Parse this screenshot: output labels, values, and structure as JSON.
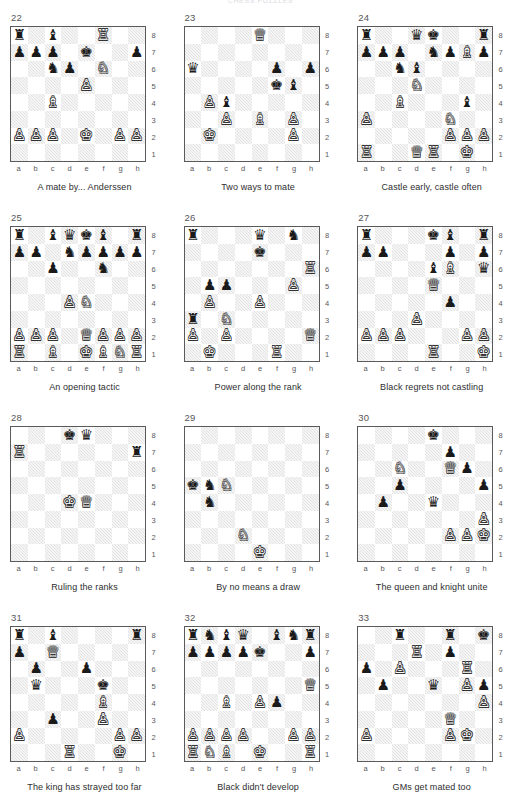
{
  "page": {
    "header": "CHESS PUZZLES",
    "files": [
      "a",
      "b",
      "c",
      "d",
      "e",
      "f",
      "g",
      "h"
    ],
    "ranks": [
      "8",
      "7",
      "6",
      "5",
      "4",
      "3",
      "2",
      "1"
    ],
    "colors": {
      "light_square": "#ffffff",
      "dark_square": "#e3e3e3",
      "board_border": "#5a5a5a",
      "text": "#2e2e30",
      "coord_text": "#58585c",
      "number_text": "#555558"
    },
    "glyphs": {
      "wK": "♔",
      "wQ": "♕",
      "wR": "♖",
      "wB": "♗",
      "wN": "♘",
      "wP": "♙",
      "bK": "♚",
      "bQ": "♛",
      "bR": "♜",
      "bB": "♝",
      "bN": "♞",
      "bP": "♟"
    }
  },
  "chart_data": {
    "type": "table",
    "note": "Twelve chess board diagrams arranged in a 3-column by 4-row grid; each has a number label, an 8x8 position with algebraic coordinates, and a caption.",
    "columns": 3,
    "rows": 4,
    "puzzles": [
      {
        "number": "22",
        "caption": "A mate by... Anderssen",
        "pieces": [
          {
            "sq": "a8",
            "p": "bR"
          },
          {
            "sq": "c8",
            "p": "bB"
          },
          {
            "sq": "f8",
            "p": "wR"
          },
          {
            "sq": "a7",
            "p": "bP"
          },
          {
            "sq": "b7",
            "p": "bP"
          },
          {
            "sq": "c7",
            "p": "bP"
          },
          {
            "sq": "e7",
            "p": "bK"
          },
          {
            "sq": "h7",
            "p": "bP"
          },
          {
            "sq": "c6",
            "p": "bN"
          },
          {
            "sq": "d6",
            "p": "bP"
          },
          {
            "sq": "f6",
            "p": "wN"
          },
          {
            "sq": "e5",
            "p": "wP"
          },
          {
            "sq": "c4",
            "p": "wB"
          },
          {
            "sq": "a2",
            "p": "wP"
          },
          {
            "sq": "b2",
            "p": "wP"
          },
          {
            "sq": "c2",
            "p": "wP"
          },
          {
            "sq": "e2",
            "p": "wK"
          },
          {
            "sq": "g2",
            "p": "wP"
          },
          {
            "sq": "h2",
            "p": "wP"
          }
        ]
      },
      {
        "number": "23",
        "caption": "Two ways to mate",
        "pieces": [
          {
            "sq": "e8",
            "p": "wQ"
          },
          {
            "sq": "a6",
            "p": "bQ"
          },
          {
            "sq": "f6",
            "p": "bP"
          },
          {
            "sq": "h6",
            "p": "bP"
          },
          {
            "sq": "f5",
            "p": "bK"
          },
          {
            "sq": "g5",
            "p": "bB"
          },
          {
            "sq": "b4",
            "p": "wP"
          },
          {
            "sq": "c4",
            "p": "bB"
          },
          {
            "sq": "c3",
            "p": "wP"
          },
          {
            "sq": "e3",
            "p": "wB"
          },
          {
            "sq": "g3",
            "p": "wP"
          },
          {
            "sq": "b2",
            "p": "wK"
          },
          {
            "sq": "g2",
            "p": "wP"
          }
        ]
      },
      {
        "number": "24",
        "caption": "Castle early, castle often",
        "pieces": [
          {
            "sq": "a8",
            "p": "bR"
          },
          {
            "sq": "d8",
            "p": "bQ"
          },
          {
            "sq": "e8",
            "p": "bK"
          },
          {
            "sq": "h8",
            "p": "bR"
          },
          {
            "sq": "a7",
            "p": "bP"
          },
          {
            "sq": "b7",
            "p": "bP"
          },
          {
            "sq": "c7",
            "p": "bP"
          },
          {
            "sq": "e7",
            "p": "bN"
          },
          {
            "sq": "f7",
            "p": "bP"
          },
          {
            "sq": "g7",
            "p": "wB"
          },
          {
            "sq": "h7",
            "p": "bP"
          },
          {
            "sq": "c6",
            "p": "bN"
          },
          {
            "sq": "d6",
            "p": "bB"
          },
          {
            "sq": "d5",
            "p": "wN"
          },
          {
            "sq": "c4",
            "p": "wB"
          },
          {
            "sq": "g4",
            "p": "bB"
          },
          {
            "sq": "a3",
            "p": "wP"
          },
          {
            "sq": "f3",
            "p": "wN"
          },
          {
            "sq": "f2",
            "p": "wP"
          },
          {
            "sq": "g2",
            "p": "wP"
          },
          {
            "sq": "h2",
            "p": "wP"
          },
          {
            "sq": "a1",
            "p": "wR"
          },
          {
            "sq": "d1",
            "p": "wQ"
          },
          {
            "sq": "e1",
            "p": "wR"
          },
          {
            "sq": "g1",
            "p": "wK"
          }
        ]
      },
      {
        "number": "25",
        "caption": "An opening tactic",
        "pieces": [
          {
            "sq": "a8",
            "p": "bR"
          },
          {
            "sq": "c8",
            "p": "bB"
          },
          {
            "sq": "d8",
            "p": "bQ"
          },
          {
            "sq": "e8",
            "p": "bK"
          },
          {
            "sq": "f8",
            "p": "bB"
          },
          {
            "sq": "h8",
            "p": "bR"
          },
          {
            "sq": "a7",
            "p": "bP"
          },
          {
            "sq": "b7",
            "p": "bP"
          },
          {
            "sq": "d7",
            "p": "bN"
          },
          {
            "sq": "e7",
            "p": "bP"
          },
          {
            "sq": "f7",
            "p": "bP"
          },
          {
            "sq": "g7",
            "p": "bP"
          },
          {
            "sq": "h7",
            "p": "bP"
          },
          {
            "sq": "c6",
            "p": "bP"
          },
          {
            "sq": "f6",
            "p": "bN"
          },
          {
            "sq": "d4",
            "p": "wP"
          },
          {
            "sq": "e4",
            "p": "wN"
          },
          {
            "sq": "a2",
            "p": "wP"
          },
          {
            "sq": "b2",
            "p": "wP"
          },
          {
            "sq": "c2",
            "p": "wP"
          },
          {
            "sq": "e2",
            "p": "wQ"
          },
          {
            "sq": "f2",
            "p": "wP"
          },
          {
            "sq": "g2",
            "p": "wP"
          },
          {
            "sq": "h2",
            "p": "wP"
          },
          {
            "sq": "a1",
            "p": "wR"
          },
          {
            "sq": "c1",
            "p": "wB"
          },
          {
            "sq": "e1",
            "p": "wK"
          },
          {
            "sq": "f1",
            "p": "wB"
          },
          {
            "sq": "g1",
            "p": "wN"
          },
          {
            "sq": "h1",
            "p": "wR"
          }
        ]
      },
      {
        "number": "26",
        "caption": "Power along the rank",
        "pieces": [
          {
            "sq": "a8",
            "p": "bR"
          },
          {
            "sq": "e8",
            "p": "bQ"
          },
          {
            "sq": "g8",
            "p": "bN"
          },
          {
            "sq": "e7",
            "p": "bK"
          },
          {
            "sq": "h6",
            "p": "wR"
          },
          {
            "sq": "b5",
            "p": "bP"
          },
          {
            "sq": "c5",
            "p": "bP"
          },
          {
            "sq": "g5",
            "p": "wP"
          },
          {
            "sq": "b4",
            "p": "wP"
          },
          {
            "sq": "e4",
            "p": "wP"
          },
          {
            "sq": "a3",
            "p": "bR"
          },
          {
            "sq": "c3",
            "p": "wN"
          },
          {
            "sq": "a2",
            "p": "wP"
          },
          {
            "sq": "c2",
            "p": "wP"
          },
          {
            "sq": "h2",
            "p": "wQ"
          },
          {
            "sq": "b1",
            "p": "wK"
          },
          {
            "sq": "f1",
            "p": "wR"
          }
        ]
      },
      {
        "number": "27",
        "caption": "Black regrets not castling",
        "pieces": [
          {
            "sq": "a8",
            "p": "bR"
          },
          {
            "sq": "e8",
            "p": "bK"
          },
          {
            "sq": "f8",
            "p": "bB"
          },
          {
            "sq": "h8",
            "p": "bR"
          },
          {
            "sq": "a7",
            "p": "bP"
          },
          {
            "sq": "b7",
            "p": "bP"
          },
          {
            "sq": "f7",
            "p": "bP"
          },
          {
            "sq": "h7",
            "p": "bP"
          },
          {
            "sq": "e6",
            "p": "bB"
          },
          {
            "sq": "f6",
            "p": "wB"
          },
          {
            "sq": "h6",
            "p": "bQ"
          },
          {
            "sq": "e5",
            "p": "wQ"
          },
          {
            "sq": "f4",
            "p": "bP"
          },
          {
            "sq": "d3",
            "p": "wP"
          },
          {
            "sq": "a2",
            "p": "wP"
          },
          {
            "sq": "b2",
            "p": "wP"
          },
          {
            "sq": "c2",
            "p": "wP"
          },
          {
            "sq": "g2",
            "p": "wP"
          },
          {
            "sq": "h2",
            "p": "wP"
          },
          {
            "sq": "e1",
            "p": "wR"
          },
          {
            "sq": "h1",
            "p": "wK"
          }
        ]
      },
      {
        "number": "28",
        "caption": "Ruling the ranks",
        "pieces": [
          {
            "sq": "d8",
            "p": "bK"
          },
          {
            "sq": "e8",
            "p": "bQ"
          },
          {
            "sq": "a7",
            "p": "wR"
          },
          {
            "sq": "h7",
            "p": "bR"
          },
          {
            "sq": "d4",
            "p": "wK"
          },
          {
            "sq": "e4",
            "p": "wQ"
          }
        ]
      },
      {
        "number": "29",
        "caption": "By no means a draw",
        "pieces": [
          {
            "sq": "a5",
            "p": "bK"
          },
          {
            "sq": "b5",
            "p": "bN"
          },
          {
            "sq": "c5",
            "p": "wN"
          },
          {
            "sq": "b4",
            "p": "bN"
          },
          {
            "sq": "d2",
            "p": "wN"
          },
          {
            "sq": "e1",
            "p": "wK"
          }
        ]
      },
      {
        "number": "30",
        "caption": "The queen and knight unite",
        "pieces": [
          {
            "sq": "e8",
            "p": "bK"
          },
          {
            "sq": "f7",
            "p": "bP"
          },
          {
            "sq": "c6",
            "p": "wN"
          },
          {
            "sq": "f6",
            "p": "wQ"
          },
          {
            "sq": "g6",
            "p": "bP"
          },
          {
            "sq": "c5",
            "p": "bP"
          },
          {
            "sq": "h5",
            "p": "bP"
          },
          {
            "sq": "b4",
            "p": "bP"
          },
          {
            "sq": "e4",
            "p": "bQ"
          },
          {
            "sq": "h3",
            "p": "wP"
          },
          {
            "sq": "f2",
            "p": "wP"
          },
          {
            "sq": "g2",
            "p": "wP"
          },
          {
            "sq": "h2",
            "p": "wK"
          }
        ]
      },
      {
        "number": "31",
        "caption": "The king has strayed too far",
        "pieces": [
          {
            "sq": "a8",
            "p": "bR"
          },
          {
            "sq": "c8",
            "p": "bB"
          },
          {
            "sq": "h8",
            "p": "bR"
          },
          {
            "sq": "a7",
            "p": "bP"
          },
          {
            "sq": "c7",
            "p": "wQ"
          },
          {
            "sq": "b6",
            "p": "bP"
          },
          {
            "sq": "e6",
            "p": "bP"
          },
          {
            "sq": "b5",
            "p": "bQ"
          },
          {
            "sq": "f5",
            "p": "bK"
          },
          {
            "sq": "f4",
            "p": "wB"
          },
          {
            "sq": "c3",
            "p": "bP"
          },
          {
            "sq": "f3",
            "p": "wP"
          },
          {
            "sq": "a2",
            "p": "wP"
          },
          {
            "sq": "g2",
            "p": "wP"
          },
          {
            "sq": "h2",
            "p": "wP"
          },
          {
            "sq": "d1",
            "p": "wR"
          },
          {
            "sq": "g1",
            "p": "wK"
          }
        ]
      },
      {
        "number": "32",
        "caption": "Black didn't develop",
        "pieces": [
          {
            "sq": "a8",
            "p": "bR"
          },
          {
            "sq": "b8",
            "p": "bN"
          },
          {
            "sq": "c8",
            "p": "bB"
          },
          {
            "sq": "d8",
            "p": "bQ"
          },
          {
            "sq": "f8",
            "p": "bB"
          },
          {
            "sq": "g8",
            "p": "bN"
          },
          {
            "sq": "h8",
            "p": "bR"
          },
          {
            "sq": "a7",
            "p": "bP"
          },
          {
            "sq": "b7",
            "p": "bP"
          },
          {
            "sq": "c7",
            "p": "bP"
          },
          {
            "sq": "d7",
            "p": "bP"
          },
          {
            "sq": "e7",
            "p": "bK"
          },
          {
            "sq": "h7",
            "p": "bP"
          },
          {
            "sq": "h5",
            "p": "wQ"
          },
          {
            "sq": "c4",
            "p": "wB"
          },
          {
            "sq": "e4",
            "p": "wP"
          },
          {
            "sq": "f4",
            "p": "bP"
          },
          {
            "sq": "a2",
            "p": "wP"
          },
          {
            "sq": "b2",
            "p": "wP"
          },
          {
            "sq": "c2",
            "p": "wP"
          },
          {
            "sq": "d2",
            "p": "wP"
          },
          {
            "sq": "g2",
            "p": "wP"
          },
          {
            "sq": "h2",
            "p": "wP"
          },
          {
            "sq": "a1",
            "p": "wR"
          },
          {
            "sq": "b1",
            "p": "wN"
          },
          {
            "sq": "c1",
            "p": "wB"
          },
          {
            "sq": "e1",
            "p": "wK"
          },
          {
            "sq": "h1",
            "p": "wR"
          }
        ]
      },
      {
        "number": "33",
        "caption": "GMs get mated too",
        "pieces": [
          {
            "sq": "c8",
            "p": "bR"
          },
          {
            "sq": "f8",
            "p": "bR"
          },
          {
            "sq": "h8",
            "p": "bK"
          },
          {
            "sq": "d7",
            "p": "wR"
          },
          {
            "sq": "f7",
            "p": "bP"
          },
          {
            "sq": "a6",
            "p": "bP"
          },
          {
            "sq": "c6",
            "p": "wP"
          },
          {
            "sq": "g6",
            "p": "wR"
          },
          {
            "sq": "b5",
            "p": "bP"
          },
          {
            "sq": "e5",
            "p": "bQ"
          },
          {
            "sq": "g5",
            "p": "wP"
          },
          {
            "sq": "h5",
            "p": "bP"
          },
          {
            "sq": "h4",
            "p": "wP"
          },
          {
            "sq": "f3",
            "p": "wQ"
          },
          {
            "sq": "a2",
            "p": "wP"
          },
          {
            "sq": "f2",
            "p": "wP"
          },
          {
            "sq": "g2",
            "p": "wK"
          }
        ]
      }
    ]
  }
}
